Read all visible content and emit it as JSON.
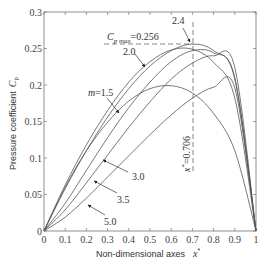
{
  "chart_data": {
    "type": "line",
    "title": "",
    "xlabel": "Non-dimensional axes",
    "xlabel_symbol": "x*",
    "ylabel": "Pressure coefficient",
    "ylabel_symbol": "Cp",
    "xlim": [
      0,
      1
    ],
    "ylim": [
      0,
      0.3
    ],
    "grid": false,
    "legend": "none (inline annotations)",
    "x_ticks": [
      "0",
      "0.1",
      "0.2",
      "0.3",
      "0.4",
      "0.5",
      "0.6",
      "0.7",
      "0.8",
      "0.9",
      "1"
    ],
    "y_ticks": [
      "0",
      "0.05",
      "0.1",
      "0.15",
      "0.2",
      "0.25",
      "0.3"
    ],
    "x": [
      0,
      0.1,
      0.2,
      0.3,
      0.4,
      0.5,
      0.6,
      0.7,
      0.8,
      0.9,
      1.0
    ],
    "series": [
      {
        "name": "m=1.5",
        "values": [
          0,
          0.06,
          0.11,
          0.149,
          0.178,
          0.195,
          0.199,
          0.189,
          0.161,
          0.11,
          0
        ]
      },
      {
        "name": "m=2.0",
        "values": [
          0,
          0.063,
          0.118,
          0.165,
          0.204,
          0.232,
          0.248,
          0.249,
          0.231,
          0.182,
          0
        ]
      },
      {
        "name": "m=2.4",
        "values": [
          0,
          0.058,
          0.11,
          0.156,
          0.195,
          0.226,
          0.247,
          0.256,
          0.247,
          0.208,
          0
        ]
      },
      {
        "name": "m=3.0",
        "values": [
          0,
          0.038,
          0.083,
          0.128,
          0.169,
          0.204,
          0.232,
          0.247,
          0.244,
          0.21,
          0
        ]
      },
      {
        "name": "m=3.5",
        "values": [
          0,
          0.029,
          0.066,
          0.104,
          0.142,
          0.177,
          0.208,
          0.23,
          0.24,
          0.224,
          0
        ]
      },
      {
        "name": "m=5.0",
        "values": [
          0,
          0.019,
          0.045,
          0.074,
          0.103,
          0.132,
          0.159,
          0.182,
          0.197,
          0.196,
          0
        ]
      }
    ],
    "annotations": [
      {
        "text": "Cp max=0.256",
        "target": [
          0.706,
          0.256
        ],
        "type": "horizontal-dashed"
      },
      {
        "text": "x*=0.706",
        "target": [
          0.706,
          0.256
        ],
        "type": "vertical-dashed"
      },
      {
        "text": "2.4",
        "points_to": [
          0.62,
          0.256
        ]
      },
      {
        "text": "2.0",
        "points_to": [
          0.42,
          0.215
        ]
      },
      {
        "text": "m=1.5",
        "points_to": [
          0.355,
          0.162
        ]
      },
      {
        "text": "3.0",
        "points_to": [
          0.27,
          0.099
        ]
      },
      {
        "text": "3.5",
        "points_to": [
          0.23,
          0.07
        ]
      },
      {
        "text": "5.0",
        "points_to": [
          0.2,
          0.036
        ]
      }
    ]
  },
  "labels": {
    "ylabel": "Pressure coefficient",
    "ylabel_sym": "C",
    "ylabel_sub": "p",
    "xlabel": "Non-dimensional axes",
    "xlabel_sym": "x",
    "xlabel_sup": "*",
    "cpmax_main": "C",
    "cpmax_sub": "p max",
    "cpmax_val": "=0.256",
    "xstar_text": "=0.706",
    "xstar_sym": "x",
    "xstar_sup": "*",
    "m_prefix": "m",
    "m15": "=1.5",
    "a24": "2.4",
    "a20": "2.0",
    "a30": "3.0",
    "a35": "3.5",
    "a50": "5.0"
  }
}
